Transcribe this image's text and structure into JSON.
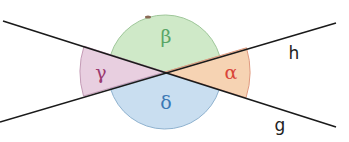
{
  "diagram": {
    "intersection": {
      "x": 165,
      "y": 72
    },
    "lines": [
      {
        "name": "h",
        "from": [
          0,
          122
        ],
        "to": [
          336,
          23
        ],
        "label_pos": [
          289,
          59
        ]
      },
      {
        "name": "g",
        "from": [
          3,
          21
        ],
        "to": [
          336,
          127
        ],
        "label_pos": [
          275,
          131
        ]
      }
    ],
    "angles": [
      {
        "name": "alpha",
        "symbol": "α",
        "color": "#f6d3b3",
        "stroke": "#e09a80",
        "text_color": "#d9453a",
        "radius": 85,
        "label_pos": [
          231,
          79
        ]
      },
      {
        "name": "beta",
        "symbol": "β",
        "color": "#cfe9c8",
        "stroke": "#9fc79a",
        "text_color": "#5aa566",
        "radius": 57,
        "label_pos": [
          166,
          42
        ]
      },
      {
        "name": "gamma",
        "symbol": "γ",
        "color": "#e8cfe0",
        "stroke": "#c49bb6",
        "text_color": "#9b3a6f",
        "radius": 85,
        "label_pos": [
          101,
          79
        ]
      },
      {
        "name": "delta",
        "symbol": "δ",
        "color": "#c9def0",
        "stroke": "#8fb2cf",
        "text_color": "#3b78b5",
        "radius": 57,
        "label_pos": [
          166,
          108
        ]
      }
    ]
  }
}
